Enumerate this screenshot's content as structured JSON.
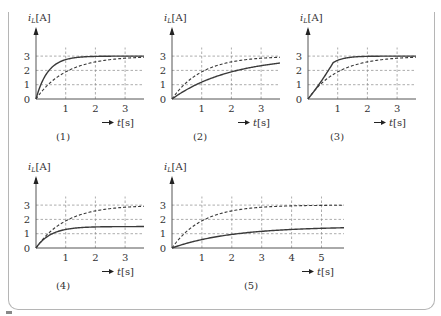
{
  "chart_data": [
    {
      "id": "1",
      "type": "line",
      "caption": "(1)",
      "ylabel": "iL[A]",
      "xlabel": "t[s]",
      "x_ticks": [
        "1",
        "2",
        "3"
      ],
      "y_ticks": [
        "0",
        "1",
        "2",
        "3"
      ],
      "xlim": [
        0,
        3.6
      ],
      "ylim": [
        0,
        3
      ],
      "grid": true,
      "series": [
        {
          "name": "reference (dashed)",
          "style": "dashed",
          "final": 3,
          "tau": 1.0,
          "shape": "exp"
        },
        {
          "name": "response (solid)",
          "style": "solid",
          "final": 3,
          "tau": 0.4,
          "shape": "exp"
        }
      ]
    },
    {
      "id": "2",
      "type": "line",
      "caption": "(2)",
      "ylabel": "iL[A]",
      "xlabel": "t[s]",
      "x_ticks": [
        "1",
        "2",
        "3"
      ],
      "y_ticks": [
        "0",
        "1",
        "2",
        "3"
      ],
      "xlim": [
        0,
        3.6
      ],
      "ylim": [
        0,
        3
      ],
      "grid": true,
      "series": [
        {
          "name": "reference (dashed)",
          "style": "dashed",
          "final": 3,
          "tau": 1.0,
          "shape": "exp"
        },
        {
          "name": "response (solid)",
          "style": "solid",
          "final": 3,
          "tau": 2.0,
          "shape": "exp"
        }
      ]
    },
    {
      "id": "3",
      "type": "line",
      "caption": "(3)",
      "ylabel": "iL[A]",
      "xlabel": "t[s]",
      "x_ticks": [
        "1",
        "2",
        "3"
      ],
      "y_ticks": [
        "0",
        "1",
        "2",
        "3"
      ],
      "xlim": [
        0,
        3.6
      ],
      "ylim": [
        0,
        3
      ],
      "grid": true,
      "series": [
        {
          "name": "reference (dashed)",
          "style": "dashed",
          "final": 3,
          "tau": 1.0,
          "shape": "exp"
        },
        {
          "name": "response (solid)",
          "style": "solid",
          "final": 3,
          "tau": 0.35,
          "shape": "ramp-then-exp",
          "knee_t": 0.85,
          "knee_y": 2.55
        }
      ]
    },
    {
      "id": "4",
      "type": "line",
      "caption": "(4)",
      "ylabel": "iL[A]",
      "xlabel": "t[s]",
      "x_ticks": [
        "1",
        "2",
        "3"
      ],
      "y_ticks": [
        "0",
        "1",
        "2",
        "3"
      ],
      "xlim": [
        0,
        3.6
      ],
      "ylim": [
        0,
        3
      ],
      "grid": true,
      "series": [
        {
          "name": "reference (dashed)",
          "style": "dashed",
          "final": 3,
          "tau": 1.0,
          "shape": "exp"
        },
        {
          "name": "response (solid)",
          "style": "solid",
          "final": 1.5,
          "tau": 0.5,
          "shape": "exp"
        }
      ]
    },
    {
      "id": "5",
      "type": "line",
      "caption": "(5)",
      "ylabel": "iL[A]",
      "xlabel": "t[s]",
      "x_ticks": [
        "1",
        "2",
        "3",
        "4",
        "5"
      ],
      "y_ticks": [
        "0",
        "1",
        "2",
        "3"
      ],
      "xlim": [
        0,
        5.7
      ],
      "ylim": [
        0,
        3
      ],
      "grid": true,
      "series": [
        {
          "name": "reference (dashed)",
          "style": "dashed",
          "final": 3,
          "tau": 1.0,
          "shape": "exp"
        },
        {
          "name": "response (solid)",
          "style": "solid",
          "final": 1.5,
          "tau": 2.0,
          "shape": "exp"
        }
      ]
    }
  ],
  "colors": {
    "curve": "#3a3a3a",
    "grid": "#8a8a8a",
    "axis": "#555555",
    "frame": "#b5b5b5"
  }
}
